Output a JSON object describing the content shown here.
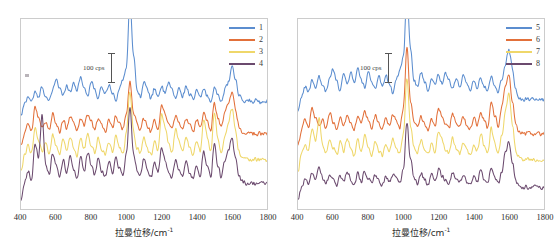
{
  "figure": {
    "background_color": "#ffffff",
    "panel_count": 2
  },
  "axis": {
    "x_title_main": "拉曼位移/cm",
    "x_title_sup": "-1",
    "tick_labels": [
      "400",
      "600",
      "800",
      "1000",
      "1200",
      "1400",
      "1600",
      "1800"
    ],
    "x_min": 400,
    "x_max": 1800,
    "tick_step": 200
  },
  "scalebar": {
    "label": "100 cps"
  },
  "colors": {
    "series_blue": "#5B8DCF",
    "series_orange": "#E2703A",
    "series_yellow": "#EFD76A",
    "series_purple": "#6B4A6E",
    "frame": "#cccccc",
    "text": "#2b2b2b"
  },
  "panels": [
    {
      "name": "left-panel",
      "legend": [
        {
          "label": "1",
          "color": "#5B8DCF"
        },
        {
          "label": "2",
          "color": "#E2703A"
        },
        {
          "label": "3",
          "color": "#EFD76A"
        },
        {
          "label": "4",
          "color": "#6B4A6E"
        }
      ]
    },
    {
      "name": "right-panel",
      "legend": [
        {
          "label": "5",
          "color": "#5B8DCF"
        },
        {
          "label": "6",
          "color": "#E2703A"
        },
        {
          "label": "7",
          "color": "#EFD76A"
        },
        {
          "label": "8",
          "color": "#6B4A6E"
        }
      ]
    }
  ],
  "chart_data": {
    "type": "line",
    "title": "",
    "xlabel": "拉曼位移/cm-1",
    "ylabel": "",
    "xlim": [
      400,
      1800
    ],
    "grid": false,
    "legend_position": "top-right",
    "note": "Stacked/offset Raman spectra; y-axis unlabelled with 100 cps scale bar. Values below are relative intensity (cps) above each trace's own baseline, sampled every 20 cm-1 from 400 to 1800.",
    "x": [
      400,
      420,
      440,
      460,
      480,
      500,
      520,
      540,
      560,
      580,
      600,
      620,
      640,
      660,
      680,
      700,
      720,
      740,
      760,
      780,
      800,
      820,
      840,
      860,
      880,
      900,
      920,
      940,
      960,
      980,
      1000,
      1020,
      1040,
      1060,
      1080,
      1100,
      1120,
      1140,
      1160,
      1180,
      1200,
      1220,
      1240,
      1260,
      1280,
      1300,
      1320,
      1340,
      1360,
      1380,
      1400,
      1420,
      1440,
      1460,
      1480,
      1500,
      1520,
      1540,
      1560,
      1580,
      1600,
      1620,
      1640,
      1660,
      1680,
      1700,
      1720,
      1740,
      1760,
      1780,
      1800
    ],
    "panels": [
      {
        "panel": "left-panel",
        "series": [
          {
            "name": "1",
            "color": "#5B8DCF",
            "values": [
              10,
              22,
              30,
              25,
              34,
              28,
              40,
              30,
              24,
              36,
              48,
              38,
              30,
              42,
              34,
              44,
              36,
              50,
              38,
              30,
              46,
              36,
              28,
              40,
              32,
              42,
              34,
              26,
              38,
              46,
              60,
              130,
              72,
              38,
              30,
              44,
              36,
              28,
              38,
              30,
              40,
              32,
              44,
              36,
              28,
              38,
              30,
              40,
              32,
              26,
              36,
              28,
              38,
              30,
              24,
              40,
              30,
              26,
              36,
              44,
              60,
              48,
              30,
              26,
              24,
              26,
              24,
              26,
              24,
              26,
              24
            ]
          },
          {
            "name": "2",
            "color": "#E2703A",
            "values": [
              12,
              24,
              34,
              28,
              52,
              40,
              30,
              36,
              28,
              44,
              34,
              26,
              38,
              30,
              42,
              34,
              26,
              40,
              32,
              44,
              36,
              28,
              40,
              32,
              26,
              38,
              30,
              42,
              34,
              28,
              44,
              78,
              46,
              34,
              28,
              40,
              32,
              26,
              38,
              30,
              52,
              44,
              36,
              30,
              42,
              34,
              28,
              40,
              32,
              26,
              38,
              30,
              44,
              36,
              28,
              56,
              40,
              30,
              44,
              56,
              66,
              50,
              32,
              26,
              24,
              24,
              24,
              24,
              24,
              24,
              24
            ]
          },
          {
            "name": "3",
            "color": "#EFD76A",
            "values": [
              14,
              30,
              40,
              32,
              60,
              46,
              34,
              42,
              32,
              52,
              40,
              30,
              46,
              34,
              50,
              38,
              30,
              48,
              36,
              54,
              40,
              32,
              48,
              36,
              30,
              44,
              34,
              50,
              38,
              32,
              52,
              96,
              54,
              38,
              32,
              48,
              36,
              30,
              44,
              34,
              72,
              60,
              42,
              34,
              56,
              44,
              34,
              50,
              38,
              30,
              46,
              34,
              66,
              50,
              34,
              74,
              48,
              34,
              50,
              62,
              78,
              56,
              34,
              28,
              26,
              26,
              26,
              26,
              26,
              26,
              26
            ]
          },
          {
            "name": "4",
            "color": "#6B4A6E",
            "values": [
              8,
              26,
              38,
              30,
              66,
              52,
              96,
              46,
              34,
              56,
              44,
              32,
              50,
              36,
              54,
              40,
              30,
              52,
              38,
              58,
              44,
              34,
              52,
              38,
              32,
              48,
              36,
              54,
              40,
              34,
              56,
              104,
              58,
              40,
              34,
              52,
              38,
              32,
              48,
              36,
              62,
              50,
              38,
              32,
              50,
              40,
              32,
              48,
              36,
              30,
              44,
              34,
              58,
              44,
              32,
              66,
              44,
              32,
              48,
              58,
              72,
              54,
              34,
              28,
              26,
              26,
              26,
              26,
              26,
              26,
              26
            ]
          }
        ]
      },
      {
        "panel": "right-panel",
        "series": [
          {
            "name": "5",
            "color": "#5B8DCF",
            "values": [
              14,
              30,
              40,
              34,
              46,
              38,
              50,
              40,
              34,
              48,
              58,
              46,
              36,
              52,
              42,
              54,
              44,
              58,
              46,
              38,
              56,
              44,
              36,
              50,
              40,
              52,
              42,
              34,
              48,
              56,
              70,
              134,
              80,
              46,
              38,
              54,
              44,
              36,
              48,
              40,
              52,
              42,
              54,
              46,
              38,
              48,
              40,
              50,
              42,
              34,
              46,
              38,
              48,
              40,
              34,
              52,
              40,
              34,
              48,
              62,
              78,
              58,
              36,
              28,
              26,
              28,
              26,
              28,
              26,
              28,
              26
            ]
          },
          {
            "name": "6",
            "color": "#E2703A",
            "values": [
              12,
              28,
              38,
              30,
              50,
              40,
              32,
              38,
              30,
              46,
              36,
              28,
              40,
              32,
              44,
              36,
              28,
              42,
              34,
              46,
              38,
              30,
              42,
              34,
              28,
              40,
              32,
              44,
              36,
              30,
              50,
              112,
              58,
              36,
              30,
              42,
              34,
              28,
              40,
              32,
              50,
              42,
              34,
              30,
              44,
              36,
              30,
              42,
              34,
              28,
              40,
              32,
              46,
              38,
              30,
              58,
              42,
              32,
              52,
              70,
              84,
              58,
              32,
              26,
              24,
              24,
              24,
              24,
              24,
              24,
              24
            ]
          },
          {
            "name": "7",
            "color": "#EFD76A",
            "values": [
              14,
              32,
              42,
              34,
              58,
              44,
              68,
              40,
              32,
              48,
              38,
              30,
              44,
              34,
              48,
              36,
              30,
              46,
              34,
              50,
              38,
              30,
              44,
              34,
              30,
              42,
              34,
              48,
              36,
              32,
              52,
              110,
              60,
              38,
              32,
              46,
              36,
              30,
              42,
              34,
              56,
              46,
              36,
              32,
              48,
              38,
              32,
              44,
              36,
              30,
              42,
              34,
              52,
              40,
              32,
              58,
              42,
              32,
              50,
              74,
              92,
              62,
              34,
              28,
              26,
              26,
              26,
              26,
              26,
              26,
              26
            ]
          },
          {
            "name": "8",
            "color": "#6B4A6E",
            "values": [
              10,
              22,
              30,
              26,
              36,
              30,
              42,
              32,
              26,
              36,
              30,
              24,
              34,
              28,
              38,
              30,
              24,
              36,
              28,
              38,
              30,
              26,
              34,
              28,
              24,
              32,
              28,
              36,
              30,
              26,
              40,
              88,
              50,
              32,
              26,
              36,
              30,
              24,
              34,
              28,
              40,
              34,
              28,
              26,
              36,
              30,
              26,
              34,
              28,
              24,
              32,
              28,
              38,
              30,
              26,
              42,
              32,
              26,
              38,
              56,
              68,
              48,
              28,
              24,
              22,
              22,
              22,
              22,
              22,
              22,
              22
            ]
          }
        ]
      }
    ]
  }
}
